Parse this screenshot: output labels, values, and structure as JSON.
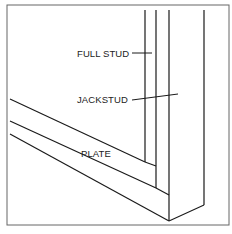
{
  "diagram": {
    "type": "framing-detail",
    "labels": {
      "full_stud": "FULL STUD",
      "jackstud": "JACKSTUD",
      "plate": "PLATE"
    },
    "colors": {
      "line": "#1a1a1a",
      "border": "#555555",
      "background": "#ffffff"
    }
  }
}
